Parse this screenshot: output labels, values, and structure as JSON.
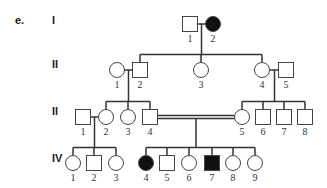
{
  "part_label": "e.",
  "generations": [
    {
      "label": "I",
      "y": 22
    },
    {
      "label": "II",
      "y": 66
    },
    {
      "label": "II",
      "y": 113
    },
    {
      "label": "IV",
      "y": 160
    }
  ],
  "colors": {
    "affected": "#111111",
    "unaffected": "#ffffff",
    "line": "#333333"
  },
  "individuals": [
    {
      "id": "I-1",
      "gen": "I",
      "num": "1",
      "sex": "male",
      "affected": false,
      "x": 190,
      "y": 24
    },
    {
      "id": "I-2",
      "gen": "I",
      "num": "2",
      "sex": "female",
      "affected": true,
      "x": 213,
      "y": 24
    },
    {
      "id": "II-1",
      "gen": "II",
      "num": "1",
      "sex": "female",
      "affected": false,
      "x": 117,
      "y": 70
    },
    {
      "id": "II-2",
      "gen": "II",
      "num": "2",
      "sex": "male",
      "affected": false,
      "x": 140,
      "y": 70
    },
    {
      "id": "II-3",
      "gen": "II",
      "num": "3",
      "sex": "female",
      "affected": false,
      "x": 201,
      "y": 70
    },
    {
      "id": "II-4",
      "gen": "II",
      "num": "4",
      "sex": "female",
      "affected": false,
      "x": 262,
      "y": 70
    },
    {
      "id": "II-5",
      "gen": "II",
      "num": "5",
      "sex": "male",
      "affected": false,
      "x": 286,
      "y": 70
    },
    {
      "id": "III-1",
      "gen": "III",
      "num": "1",
      "sex": "male",
      "affected": false,
      "x": 83,
      "y": 117
    },
    {
      "id": "III-2",
      "gen": "III",
      "num": "2",
      "sex": "female",
      "affected": false,
      "x": 106,
      "y": 117
    },
    {
      "id": "III-3",
      "gen": "III",
      "num": "3",
      "sex": "female",
      "affected": false,
      "x": 128,
      "y": 117
    },
    {
      "id": "III-4",
      "gen": "III",
      "num": "4",
      "sex": "male",
      "affected": false,
      "x": 150,
      "y": 117
    },
    {
      "id": "III-5",
      "gen": "III",
      "num": "5",
      "sex": "female",
      "affected": false,
      "x": 242,
      "y": 117
    },
    {
      "id": "III-6",
      "gen": "III",
      "num": "6",
      "sex": "male",
      "affected": false,
      "x": 263,
      "y": 117
    },
    {
      "id": "III-7",
      "gen": "III",
      "num": "7",
      "sex": "male",
      "affected": false,
      "x": 284,
      "y": 117
    },
    {
      "id": "III-8",
      "gen": "III",
      "num": "8",
      "sex": "male",
      "affected": false,
      "x": 305,
      "y": 117
    },
    {
      "id": "IV-1",
      "gen": "IV",
      "num": "1",
      "sex": "female",
      "affected": false,
      "x": 73,
      "y": 163
    },
    {
      "id": "IV-2",
      "gen": "IV",
      "num": "2",
      "sex": "male",
      "affected": false,
      "x": 94,
      "y": 163
    },
    {
      "id": "IV-3",
      "gen": "IV",
      "num": "3",
      "sex": "female",
      "affected": false,
      "x": 116,
      "y": 163
    },
    {
      "id": "IV-4",
      "gen": "IV",
      "num": "4",
      "sex": "female",
      "affected": true,
      "x": 146,
      "y": 163
    },
    {
      "id": "IV-5",
      "gen": "IV",
      "num": "5",
      "sex": "male",
      "affected": false,
      "x": 167,
      "y": 163
    },
    {
      "id": "IV-6",
      "gen": "IV",
      "num": "6",
      "sex": "female",
      "affected": false,
      "x": 189,
      "y": 163
    },
    {
      "id": "IV-7",
      "gen": "IV",
      "num": "7",
      "sex": "male",
      "affected": true,
      "x": 212,
      "y": 163
    },
    {
      "id": "IV-8",
      "gen": "IV",
      "num": "8",
      "sex": "female",
      "affected": false,
      "x": 233,
      "y": 163
    },
    {
      "id": "IV-9",
      "gen": "IV",
      "num": "9",
      "sex": "female",
      "affected": false,
      "x": 255,
      "y": 163
    }
  ],
  "matings": [
    {
      "partners": [
        "I-1",
        "I-2"
      ],
      "consanguineous": false,
      "children": [
        "II-2",
        "II-3",
        "II-4"
      ]
    },
    {
      "partners": [
        "II-1",
        "II-2"
      ],
      "consanguineous": false,
      "children": [
        "III-2",
        "III-3",
        "III-4"
      ]
    },
    {
      "partners": [
        "II-4",
        "II-5"
      ],
      "consanguineous": false,
      "children": [
        "III-5",
        "III-6",
        "III-7",
        "III-8"
      ]
    },
    {
      "partners": [
        "III-1",
        "III-2"
      ],
      "consanguineous": false,
      "children": [
        "IV-1",
        "IV-2",
        "IV-3"
      ]
    },
    {
      "partners": [
        "III-4",
        "III-5"
      ],
      "consanguineous": true,
      "children": [
        "IV-4",
        "IV-5",
        "IV-6",
        "IV-7",
        "IV-8",
        "IV-9"
      ]
    }
  ]
}
